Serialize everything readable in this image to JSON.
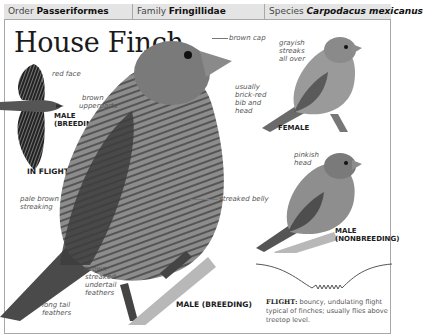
{
  "header": {
    "order": {
      "label": "Order",
      "value": "Passeriformes"
    },
    "family": {
      "label": "Family",
      "value": "Fringillidae"
    },
    "species": {
      "label": "Species",
      "value": "Carpodacus mexicanus"
    }
  },
  "title": "House Finch",
  "illustrations": {
    "in_flight": {
      "caption": "IN FLIGHT",
      "sub_caption_line1": "MALE",
      "sub_caption_line2": "(BREEDING)",
      "labels": {
        "red_face": "red face"
      }
    },
    "male_breeding": {
      "caption": "MALE (BREEDING)",
      "labels": {
        "brown_cap": "brown cap",
        "brown_upperparts_1": "brown",
        "brown_upperparts_2": "upperparts",
        "bib_1": "usually",
        "bib_2": "brick-red",
        "bib_3": "bib and",
        "bib_4": "head",
        "pale_streaking_1": "pale brown",
        "pale_streaking_2": "streaking",
        "streaked_belly": "streaked belly",
        "undertail_1": "brown",
        "undertail_2": "streaked",
        "undertail_3": "undertail",
        "undertail_4": "feathers",
        "tail_1": "long tail",
        "tail_2": "feathers"
      }
    },
    "female": {
      "caption": "FEMALE",
      "labels": {
        "streaks_1": "grayish",
        "streaks_2": "streaks",
        "streaks_3": "all over"
      }
    },
    "male_nonbreeding": {
      "caption_line1": "MALE",
      "caption_line2": "(NONBREEDING)",
      "labels": {
        "head_1": "pinkish",
        "head_2": "head"
      }
    }
  },
  "flight": {
    "heading": "FLIGHT:",
    "text": "bouncy, undulating flight typical of finches; usually flies above treetop level."
  },
  "colors": {
    "header_bg": "#e4e4e4",
    "border": "#a8a8a8",
    "text": "#1a1a1a",
    "label": "#555555"
  }
}
